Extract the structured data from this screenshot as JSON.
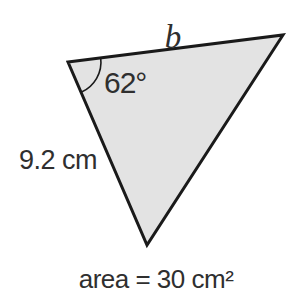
{
  "figure": {
    "type": "triangle-area-diagram",
    "labels": {
      "top_side": "b",
      "angle": "62°",
      "left_side": "9.2 cm",
      "caption": "area = 30 cm²"
    },
    "values": {
      "angle_degrees": 62,
      "left_side_length_cm": 9.2,
      "area_cm2": 30,
      "unknown_side_name": "b"
    },
    "colors": {
      "fill": "#e3e3e3",
      "stroke": "#1a1a1a",
      "text": "#2f2f2f",
      "background": "#ffffff"
    }
  }
}
